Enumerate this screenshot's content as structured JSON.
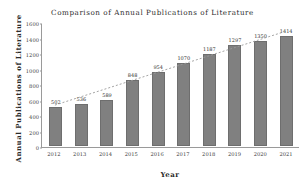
{
  "chart_data": {
    "type": "bar",
    "title": "Comparison of Annual Publications of Literature",
    "xlabel": "Year",
    "ylabel": "Annual Publications of Literature",
    "categories": [
      "2012",
      "2013",
      "2014",
      "2015",
      "2016",
      "2017",
      "2018",
      "2019",
      "2020",
      "2021"
    ],
    "values": [
      502,
      536,
      589,
      848,
      954,
      1070,
      1187,
      1297,
      1350,
      1414
    ],
    "ylim": [
      0,
      1600
    ],
    "yticks": [
      0,
      200,
      400,
      600,
      800,
      1000,
      1200,
      1400,
      1600
    ],
    "ytick_labels": [
      "0",
      "200",
      "400",
      "600",
      "800",
      "1000",
      "1200",
      "1400",
      "1600"
    ],
    "grid": false,
    "legend": null,
    "series": [
      {
        "name": "Annual Publications of Literature",
        "values": [
          502,
          536,
          589,
          848,
          954,
          1070,
          1187,
          1297,
          1350,
          1414
        ],
        "color": "#808080"
      }
    ],
    "annotations": {
      "trendline": {
        "style": "dotted",
        "color": "#9a9a9a",
        "from_value": 502,
        "to_value": 1460
      }
    },
    "bar_labels": [
      "502",
      "536",
      "589",
      "848",
      "954",
      "1070",
      "1187",
      "1297",
      "1350",
      "1414"
    ],
    "colors": {
      "bar_fill": "#808080",
      "bar_edge": "#6e6e6e",
      "axis": "#9a9a9a",
      "text": "#2b2b2b",
      "trend": "#9a9a9a"
    }
  }
}
